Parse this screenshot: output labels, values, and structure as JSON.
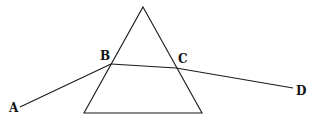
{
  "diagram": {
    "type": "prism-refraction",
    "colors": {
      "line": "#1a1a1a",
      "label": "#111111",
      "background": "#ffffff"
    },
    "prism": {
      "apex": [
        143,
        7
      ],
      "base_left": [
        84,
        113
      ],
      "base_right": [
        202,
        113
      ]
    },
    "points": {
      "A": [
        20,
        107
      ],
      "B": [
        111,
        64
      ],
      "C": [
        176,
        68
      ],
      "D": [
        293,
        88
      ]
    },
    "labels": [
      {
        "id": "A",
        "text": "A",
        "x": 9,
        "y": 112
      },
      {
        "id": "B",
        "text": "B",
        "x": 100,
        "y": 60
      },
      {
        "id": "C",
        "text": "C",
        "x": 178,
        "y": 63
      },
      {
        "id": "D",
        "text": "D",
        "x": 296,
        "y": 95
      }
    ],
    "rays": [
      {
        "id": "incident-ray",
        "from": "A",
        "to": "B"
      },
      {
        "id": "refracted-ray",
        "from": "B",
        "to": "C"
      },
      {
        "id": "emergent-ray",
        "from": "C",
        "to": "D"
      }
    ]
  }
}
